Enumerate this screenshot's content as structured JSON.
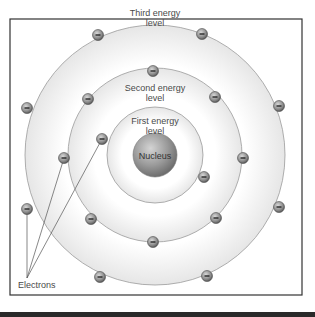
{
  "diagram": {
    "center": [
      155,
      155
    ],
    "frame": {
      "x": 10,
      "y": 19,
      "width": 292,
      "height": 276
    },
    "colors": {
      "ring_fill": "#f2f2f2",
      "ring_edge": "#9a9a9a",
      "nucleus": "#8e8e8e",
      "electron": "#8a8a8a",
      "frame": "#333333",
      "text": "#4a4a4a"
    },
    "nucleus": {
      "label": "Nucleus",
      "radius": 22
    },
    "levels": [
      {
        "name": "first",
        "label_line1": "First energy",
        "label_line2": "level",
        "radius": 48
      },
      {
        "name": "second",
        "label_line1": "Second energy",
        "label_line2": "level",
        "radius": 87
      },
      {
        "name": "third",
        "label_line1": "Third energy",
        "label_line2": "level",
        "radius": 130
      }
    ],
    "electrons": {
      "first": [
        [
          102,
          139
        ],
        [
          204,
          177
        ]
      ],
      "second": [
        [
          153,
          71
        ],
        [
          88,
          99
        ],
        [
          215,
          97
        ],
        [
          64,
          158
        ],
        [
          243,
          158
        ],
        [
          91,
          219
        ],
        [
          216,
          218
        ],
        [
          153,
          242
        ]
      ],
      "third": [
        [
          98,
          35
        ],
        [
          202,
          34
        ],
        [
          27,
          108
        ],
        [
          279,
          106
        ],
        [
          27,
          209
        ],
        [
          279,
          207
        ],
        [
          100,
          277
        ],
        [
          207,
          276
        ]
      ]
    },
    "electron_symbol": "−",
    "callout": {
      "label": "Electrons",
      "origin": [
        27,
        278
      ],
      "targets": [
        [
          27,
          209
        ],
        [
          64,
          158
        ],
        [
          102,
          139
        ]
      ]
    },
    "electron_counts": {
      "first": 2,
      "second": 8,
      "third": 8
    }
  }
}
